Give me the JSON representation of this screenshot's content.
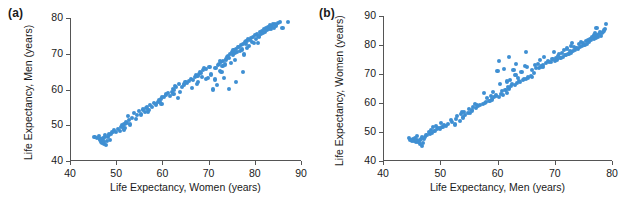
{
  "figure": {
    "background": "#ffffff",
    "marker_color": "#3f8fd2",
    "axis_color": "#555555",
    "text_color": "#1a1a1a"
  },
  "panels": {
    "a": {
      "label": "(a)",
      "xlabel": "Life Expectancy, Women (years)",
      "ylabel": "Life Expectancy, Men (years)",
      "xticks": [
        "40",
        "50",
        "60",
        "70",
        "80",
        "90"
      ],
      "yticks": [
        "40",
        "50",
        "60",
        "70",
        "80"
      ]
    },
    "b": {
      "label": "(b)",
      "xlabel": "Life Expectancy, Men (years)",
      "ylabel": "Life Expectancy, Women (years)",
      "xticks": [
        "40",
        "50",
        "60",
        "70",
        "80"
      ],
      "yticks": [
        "40",
        "50",
        "60",
        "70",
        "80",
        "90"
      ]
    }
  },
  "chart_data": [
    {
      "type": "scatter",
      "title": "(a)",
      "xlabel": "Life Expectancy, Women (years)",
      "ylabel": "Life Expectancy, Men (years)",
      "xlim": [
        40,
        90
      ],
      "ylim": [
        40,
        80
      ],
      "xticks": [
        40,
        50,
        60,
        70,
        80,
        90
      ],
      "yticks": [
        40,
        50,
        60,
        70,
        80
      ],
      "grid": false,
      "legend": null,
      "marker_color": "#3f8fd2",
      "x": [
        45.3,
        45.8,
        46.2,
        46.4,
        46.6,
        46.8,
        47.0,
        47.1,
        47.2,
        47.3,
        47.4,
        47.5,
        47.6,
        47.8,
        48.0,
        48.2,
        48.4,
        48.6,
        48.9,
        49.2,
        49.6,
        50.0,
        50.4,
        50.8,
        51.0,
        51.2,
        51.4,
        51.6,
        51.8,
        52.0,
        52.2,
        52.4,
        52.6,
        52.8,
        53.0,
        53.4,
        53.8,
        54.2,
        54.6,
        55.0,
        55.4,
        55.8,
        56.2,
        56.4,
        56.6,
        56.8,
        57.0,
        57.4,
        57.8,
        58.2,
        58.6,
        59.0,
        59.2,
        59.4,
        59.6,
        59.8,
        60.0,
        60.4,
        60.8,
        61.2,
        61.6,
        62.0,
        62.2,
        62.4,
        62.6,
        62.8,
        63.0,
        63.4,
        63.8,
        64.2,
        64.6,
        65.0,
        65.4,
        65.8,
        66.2,
        66.6,
        67.0,
        67.2,
        67.4,
        67.6,
        67.8,
        68.0,
        68.2,
        68.4,
        68.6,
        68.8,
        69.0,
        69.4,
        69.8,
        70.2,
        70.6,
        71.0,
        71.4,
        71.8,
        72.0,
        72.2,
        72.4,
        72.6,
        72.8,
        73.0,
        73.2,
        73.4,
        73.6,
        73.8,
        74.0,
        74.2,
        74.4,
        74.6,
        74.8,
        75.0,
        75.2,
        75.4,
        75.6,
        75.8,
        76.0,
        76.2,
        76.4,
        76.6,
        76.8,
        77.0,
        77.2,
        77.4,
        77.6,
        77.8,
        78.0,
        78.2,
        78.4,
        78.6,
        78.8,
        79.0,
        79.2,
        79.4,
        79.6,
        79.8,
        80.0,
        80.2,
        80.4,
        80.6,
        80.8,
        81.0,
        81.2,
        81.4,
        81.6,
        81.8,
        82.0,
        82.2,
        82.4,
        82.6,
        82.8,
        83.0,
        83.2,
        83.4,
        83.6,
        83.8,
        84.0,
        84.2,
        84.4,
        84.6,
        85.0,
        85.5,
        86.0,
        87.2,
        74.5,
        76.0,
        77.5,
        71.5,
        72.5,
        69.5,
        66.5,
        63.5
      ],
      "y": [
        46.8,
        46.5,
        47.0,
        45.8,
        46.2,
        45.4,
        45.0,
        46.0,
        46.4,
        44.8,
        45.2,
        46.6,
        47.2,
        44.6,
        45.6,
        46.8,
        47.4,
        46.0,
        47.6,
        48.2,
        48.6,
        48.0,
        49.0,
        48.4,
        49.4,
        50.0,
        49.6,
        48.8,
        50.4,
        49.2,
        51.0,
        50.6,
        52.6,
        51.4,
        50.2,
        52.0,
        53.4,
        51.8,
        52.8,
        54.0,
        53.0,
        54.4,
        53.6,
        54.8,
        55.2,
        53.8,
        54.2,
        55.6,
        55.0,
        56.2,
        55.8,
        56.6,
        57.0,
        56.4,
        57.4,
        56.0,
        57.8,
        58.0,
        58.6,
        59.0,
        58.2,
        59.4,
        60.2,
        58.8,
        59.8,
        61.0,
        60.6,
        57.6,
        59.2,
        60.8,
        61.4,
        62.0,
        61.8,
        62.4,
        63.0,
        62.6,
        63.4,
        64.0,
        61.6,
        63.8,
        62.2,
        64.4,
        65.0,
        64.6,
        63.6,
        65.4,
        66.0,
        65.8,
        63.2,
        66.4,
        64.2,
        60.0,
        62.8,
        61.2,
        66.8,
        67.2,
        65.2,
        67.6,
        64.8,
        66.6,
        68.0,
        63.2,
        67.0,
        68.4,
        69.0,
        69.4,
        68.8,
        70.0,
        67.4,
        70.4,
        69.6,
        71.0,
        70.2,
        68.2,
        71.4,
        70.6,
        72.0,
        71.8,
        70.8,
        72.4,
        71.2,
        72.8,
        69.8,
        73.2,
        72.6,
        73.6,
        71.6,
        74.0,
        72.2,
        73.8,
        74.4,
        73.4,
        74.8,
        72.9,
        75.2,
        74.2,
        75.6,
        73.0,
        75.0,
        74.6,
        76.0,
        75.4,
        76.4,
        75.8,
        76.8,
        76.2,
        77.2,
        76.6,
        77.6,
        77.0,
        78.0,
        77.4,
        76.9,
        77.8,
        78.2,
        77.1,
        78.4,
        77.9,
        78.6,
        78.8,
        77.3,
        78.9,
        60.2,
        62.0,
        65.0,
        66.0,
        68.0,
        63.0,
        60.4,
        61.6
      ]
    },
    {
      "type": "scatter",
      "title": "(b)",
      "xlabel": "Life Expectancy, Men (years)",
      "ylabel": "Life Expectancy, Women (years)",
      "xlim": [
        40,
        80
      ],
      "ylim": [
        40,
        90
      ],
      "xticks": [
        40,
        50,
        60,
        70,
        80
      ],
      "yticks": [
        40,
        50,
        60,
        70,
        80,
        90
      ],
      "grid": false,
      "legend": null,
      "marker_color": "#3f8fd2",
      "note": "Same data as panel (a) with axes transposed: x = Men, y = Women",
      "x": [
        46.8,
        46.5,
        47.0,
        45.8,
        46.2,
        45.4,
        45.0,
        46.0,
        46.4,
        44.8,
        45.2,
        46.6,
        47.2,
        44.6,
        45.6,
        46.8,
        47.4,
        46.0,
        47.6,
        48.2,
        48.6,
        48.0,
        49.0,
        48.4,
        49.4,
        50.0,
        49.6,
        48.8,
        50.4,
        49.2,
        51.0,
        50.6,
        52.6,
        51.4,
        50.2,
        52.0,
        53.4,
        51.8,
        52.8,
        54.0,
        53.0,
        54.4,
        53.6,
        54.8,
        55.2,
        53.8,
        54.2,
        55.6,
        55.0,
        56.2,
        55.8,
        56.6,
        57.0,
        56.4,
        57.4,
        56.0,
        57.8,
        58.0,
        58.6,
        59.0,
        58.2,
        59.4,
        60.2,
        58.8,
        59.8,
        61.0,
        60.6,
        57.6,
        59.2,
        60.8,
        61.4,
        62.0,
        61.8,
        62.4,
        63.0,
        62.6,
        63.4,
        64.0,
        61.6,
        63.8,
        62.2,
        64.4,
        65.0,
        64.6,
        63.6,
        65.4,
        66.0,
        65.8,
        63.2,
        66.4,
        64.2,
        60.0,
        62.8,
        61.2,
        66.8,
        67.2,
        65.2,
        67.6,
        64.8,
        66.6,
        68.0,
        63.2,
        67.0,
        68.4,
        69.0,
        69.4,
        68.8,
        70.0,
        67.4,
        70.4,
        69.6,
        71.0,
        70.2,
        68.2,
        71.4,
        70.6,
        72.0,
        71.8,
        70.8,
        72.4,
        71.2,
        72.8,
        69.8,
        73.2,
        72.6,
        73.6,
        71.6,
        74.0,
        72.2,
        73.8,
        74.4,
        73.4,
        74.8,
        72.9,
        75.2,
        74.2,
        75.6,
        73.0,
        75.0,
        74.6,
        76.0,
        75.4,
        76.4,
        75.8,
        76.8,
        76.2,
        77.2,
        76.6,
        77.6,
        77.0,
        78.0,
        77.4,
        76.9,
        77.8,
        78.2,
        77.1,
        78.4,
        77.9,
        78.6,
        78.8,
        77.3,
        78.9,
        60.2,
        62.0,
        65.0,
        66.0,
        68.0,
        63.0,
        60.4,
        61.6
      ],
      "y": [
        45.3,
        45.8,
        46.2,
        46.4,
        46.6,
        46.8,
        47.0,
        47.1,
        47.2,
        47.3,
        47.4,
        47.5,
        47.6,
        47.8,
        48.0,
        48.2,
        48.4,
        48.6,
        48.9,
        49.2,
        49.6,
        50.0,
        50.4,
        50.8,
        51.0,
        51.2,
        51.4,
        51.6,
        51.8,
        52.0,
        52.2,
        52.4,
        52.6,
        52.8,
        53.0,
        53.4,
        53.8,
        54.2,
        54.6,
        55.0,
        55.4,
        55.8,
        56.2,
        56.4,
        56.6,
        56.8,
        57.0,
        57.4,
        57.8,
        58.2,
        58.6,
        59.0,
        59.2,
        59.4,
        59.6,
        59.8,
        60.0,
        60.4,
        60.8,
        61.2,
        61.6,
        62.0,
        62.2,
        62.4,
        62.6,
        62.8,
        63.0,
        63.4,
        63.8,
        64.2,
        64.6,
        65.0,
        65.4,
        65.8,
        66.2,
        66.6,
        67.0,
        67.2,
        67.4,
        67.6,
        67.8,
        68.0,
        68.2,
        68.4,
        68.6,
        68.8,
        69.0,
        69.4,
        69.8,
        70.2,
        70.6,
        71.0,
        71.4,
        71.8,
        72.0,
        72.2,
        72.4,
        72.6,
        72.8,
        73.0,
        73.2,
        73.4,
        73.6,
        73.8,
        74.0,
        74.2,
        74.4,
        74.6,
        74.8,
        75.0,
        75.2,
        75.4,
        75.6,
        75.8,
        76.0,
        76.2,
        76.4,
        76.6,
        76.8,
        77.0,
        77.2,
        77.4,
        77.6,
        77.8,
        78.0,
        78.2,
        78.4,
        78.6,
        78.8,
        79.0,
        79.2,
        79.4,
        79.6,
        79.8,
        80.0,
        80.2,
        80.4,
        80.6,
        80.8,
        81.0,
        81.2,
        81.4,
        81.6,
        81.8,
        82.0,
        82.2,
        82.4,
        82.6,
        82.8,
        83.0,
        83.2,
        83.4,
        83.6,
        83.8,
        84.0,
        84.2,
        84.4,
        84.6,
        85.0,
        85.5,
        86.0,
        87.2,
        74.5,
        76.0,
        77.5,
        71.5,
        72.5,
        69.5,
        66.5,
        63.5
      ]
    }
  ]
}
